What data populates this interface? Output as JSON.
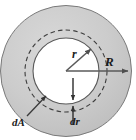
{
  "figure": {
    "canvas": {
      "width": 136,
      "height": 140,
      "background": "#ffffff"
    },
    "colors": {
      "disk_fill": "#c9c9c9",
      "disk_edge": "#6b6b6b",
      "inner_fill": "#ffffff",
      "inner_edge": "#5a5a5a",
      "dashed_edge": "#4a4a4a",
      "arrow": "#555555",
      "text": "#1a1a1a"
    },
    "geometry": {
      "center_x": 66,
      "center_y": 71,
      "outer_radius_R": 66,
      "dashed_radius_r_plus_dr": 41,
      "inner_radius_r": 33
    },
    "labels": {
      "outer_radius": "R",
      "inner_radius": "r",
      "thickness": "dr",
      "area_element": "dA"
    },
    "annotations": [
      {
        "name": "radius-R-arrow",
        "from": "center",
        "to": "outer edge, pointing right"
      },
      {
        "name": "radius-r-arrow",
        "from": "center",
        "to": "dashed circle, pointing up-right"
      },
      {
        "name": "dr-double-arrow",
        "from": "inner circle",
        "to": "dashed circle, vertical"
      },
      {
        "name": "dA-leader-line",
        "from": "dA label",
        "to": "annulus ring, lower left"
      }
    ]
  }
}
